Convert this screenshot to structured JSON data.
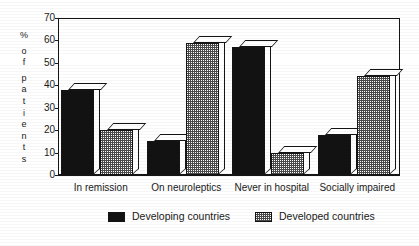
{
  "chart_data": {
    "type": "bar",
    "title": "",
    "subtitle": "",
    "xlabel": "",
    "ylabel": "% of patients",
    "ylabel_chars": [
      "%",
      "o",
      "f",
      "p",
      "a",
      "t",
      "i",
      "e",
      "n",
      "t",
      "s"
    ],
    "ylim": [
      0,
      70
    ],
    "ytick_values": [
      0,
      10,
      20,
      30,
      40,
      50,
      60,
      70
    ],
    "ytick_labels": [
      "0",
      "10",
      "20",
      "30",
      "40",
      "50",
      "60",
      "70"
    ],
    "grid": false,
    "legend_position": "bottom",
    "categories": [
      "In remission",
      "On neuroleptics",
      "Never in hospital",
      "Socially impaired"
    ],
    "series": [
      {
        "name": "Developing countries",
        "color": "#121212",
        "fill": "solid-black",
        "values": [
          38,
          15,
          57,
          18
        ]
      },
      {
        "name": "Developed countries",
        "color": "#9a9a9a",
        "fill": "stipple-grey",
        "values": [
          20,
          59,
          10,
          44
        ]
      }
    ]
  },
  "legend": {
    "items": [
      {
        "label": "Developing countries",
        "swatch": "dark"
      },
      {
        "label": "Developed countries",
        "swatch": "light"
      }
    ]
  },
  "colors": {
    "axis": "#141414",
    "text": "#1a1a1a",
    "background": "#ffffff",
    "series_dark": "#121212",
    "series_light": "#9a9a9a"
  }
}
